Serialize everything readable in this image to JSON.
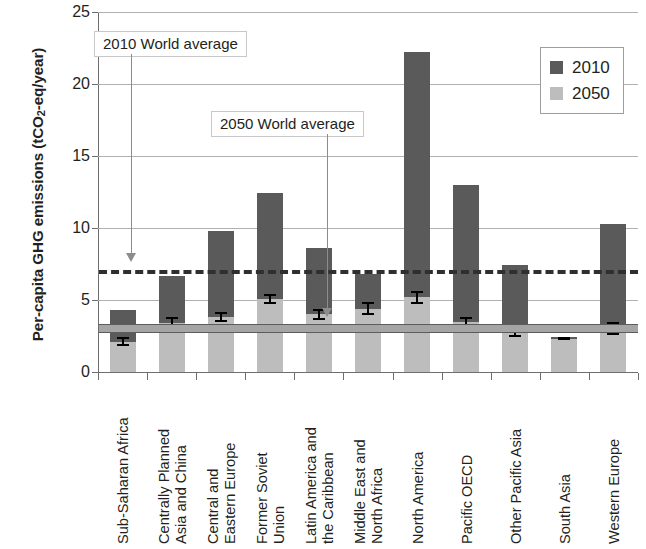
{
  "chart_data": {
    "type": "bar",
    "title": "",
    "subtitle": "",
    "xlabel": "",
    "ylabel": "Per-capita GHG emissions (tCO2-eq/year)",
    "ylim": [
      0,
      25
    ],
    "yticks": [
      0,
      5,
      10,
      15,
      20,
      25
    ],
    "grid": true,
    "legend_position": "top-right",
    "categories": [
      "Sub-Saharan Africa",
      "Centrally Planned Asia and China",
      "Central and Eastern Europe",
      "Former Soviet Union",
      "Latin America and the Caribbean",
      "Middle East and North Africa",
      "North America",
      "Pacific OECD",
      "Other Pacific Asia",
      "South Asia",
      "Western Europe"
    ],
    "category_lines": [
      [
        "Sub-Saharan Africa"
      ],
      [
        "Centrally Planned",
        "Asia and China"
      ],
      [
        "Central and",
        "Eastern Europe"
      ],
      [
        "Former Soviet",
        "Union"
      ],
      [
        "Latin America and",
        "the Caribbean"
      ],
      [
        "Middle East and",
        "North Africa"
      ],
      [
        "North America"
      ],
      [
        "Pacific OECD"
      ],
      [
        "Other Pacific Asia"
      ],
      [
        "South Asia"
      ],
      [
        "Western Europe"
      ]
    ],
    "series": [
      {
        "name": "2010",
        "color": "#5a5a5a",
        "values": [
          4.3,
          6.7,
          9.8,
          12.4,
          8.6,
          6.8,
          22.2,
          13.0,
          7.4,
          2.4,
          10.3
        ]
      },
      {
        "name": "2050",
        "color": "#bdbdbd",
        "values": [
          2.1,
          3.4,
          3.8,
          5.1,
          4.0,
          4.4,
          5.2,
          3.5,
          2.7,
          2.3,
          3.0
        ],
        "errors": [
          0.3,
          0.45,
          0.35,
          0.35,
          0.4,
          0.45,
          0.45,
          0.35,
          0.3,
          0.1,
          0.45
        ]
      }
    ],
    "reference_lines": [
      {
        "name": "2010 World average",
        "value": 7.1,
        "style": "dashed",
        "color": "#2f2f2f",
        "label": "2010 World average"
      },
      {
        "name": "2050 World average",
        "value": 3.05,
        "style": "solid-band",
        "color": "#a5a5a5",
        "label": "2050 World average"
      }
    ]
  },
  "legend": {
    "entries": [
      {
        "label": "2010",
        "color": "#5a5a5a"
      },
      {
        "label": "2050",
        "color": "#bdbdbd"
      }
    ]
  },
  "annotations": {
    "a2010": {
      "text": "2010 World average"
    },
    "a2050": {
      "text": "2050 World average"
    }
  },
  "y_axis": {
    "title_main": "Per-capita GHG emissions (tCO",
    "title_sub": "2",
    "title_tail": "-eq/year)",
    "ticks": [
      "25",
      "20",
      "15",
      "10",
      "5",
      "0"
    ]
  }
}
